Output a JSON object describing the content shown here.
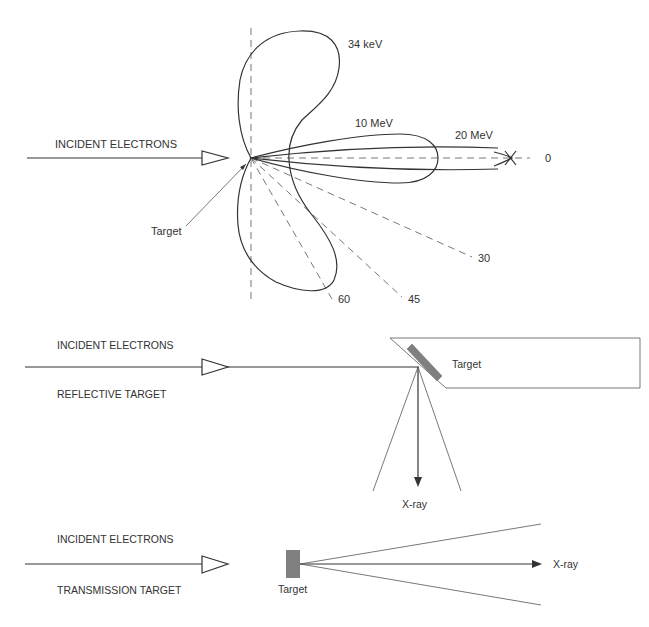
{
  "figure": {
    "top_panel": {
      "incident_label": "INCIDENT ELECTRONS",
      "target_label": "Target",
      "lobes": [
        {
          "label": "34 keV"
        },
        {
          "label": "10 MeV"
        },
        {
          "label": "20 MeV"
        }
      ],
      "angle_labels": {
        "a0": "0",
        "a30": "30",
        "a45": "45",
        "a60": "60"
      }
    },
    "middle_panel": {
      "incident_label": "INCIDENT ELECTRONS",
      "type_label": "REFLECTIVE TARGET",
      "target_label": "Target",
      "output_label": "X-ray"
    },
    "bottom_panel": {
      "incident_label": "INCIDENT ELECTRONS",
      "type_label": "TRANSMISSION TARGET",
      "target_label": "Target",
      "output_label": "X-ray"
    },
    "colors": {
      "line": "#333333",
      "dash": "#777777",
      "target_fill": "#808080"
    }
  }
}
